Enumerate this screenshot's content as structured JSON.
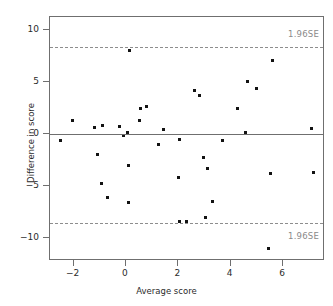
{
  "chart_data": {
    "type": "scatter",
    "title": "",
    "xlabel": "Average score",
    "ylabel": "Difference in score",
    "xlim": [
      -2.9,
      7.6
    ],
    "ylim": [
      -12.2,
      11.3
    ],
    "xticks": [
      -2,
      0,
      2,
      4,
      6
    ],
    "xticklabels": [
      "−2",
      "0",
      "2",
      "4",
      "6"
    ],
    "yticks": [
      -10,
      -5,
      0,
      5,
      10
    ],
    "yticklabels": [
      "−10",
      "−5",
      "0",
      "5",
      "10"
    ],
    "grid": false,
    "legend": null,
    "reference_lines": [
      {
        "name": "mean-difference",
        "y": 0,
        "style": "solid",
        "label": ""
      },
      {
        "name": "upper-limit-of-agreement",
        "y": 8.45,
        "style": "dashed",
        "label": "1.96SE"
      },
      {
        "name": "lower-limit-of-agreement",
        "y": -8.55,
        "style": "dashed",
        "label": "1.96SE"
      }
    ],
    "annotations": [
      {
        "name": "upper-loa-label",
        "text": "1.96SE",
        "x": 6.6,
        "y": 9.6
      },
      {
        "name": "lower-loa-label",
        "text": "1.96SE",
        "x": 6.6,
        "y": -9.9
      }
    ],
    "x": [
      -2.5,
      -2.05,
      -1.2,
      -1.1,
      -0.9,
      -0.95,
      -0.7,
      -0.25,
      -0.1,
      0.05,
      0.1,
      0.1,
      0.15,
      0.5,
      0.55,
      0.8,
      1.25,
      1.45,
      2.0,
      2.05,
      2.05,
      2.3,
      2.6,
      2.8,
      2.95,
      3.05,
      3.1,
      3.3,
      3.7,
      4.25,
      4.55,
      4.65,
      5.0,
      5.45,
      5.5,
      5.6,
      7.1,
      7.15
    ],
    "y": [
      -0.6,
      1.35,
      0.7,
      -1.9,
      0.85,
      -4.7,
      -6.1,
      0.8,
      -0.15,
      0.15,
      -3.05,
      -6.6,
      8.1,
      1.3,
      2.5,
      2.7,
      -0.95,
      0.45,
      -4.2,
      -0.5,
      -8.4,
      -8.4,
      4.2,
      3.75,
      -2.2,
      -8.0,
      -3.25,
      -6.5,
      -0.55,
      2.5,
      0.2,
      5.1,
      4.4,
      -11.0,
      -3.8,
      7.1,
      0.6,
      -3.7
    ],
    "marker": {
      "shape": "square",
      "color": "#131313",
      "size": 3
    },
    "n_points": 38
  },
  "style": {
    "frame_color": "#6f6f6f",
    "dash_color": "#8d8d8d",
    "text_color": "#2b2b2b",
    "annotation_color": "#8a8a8a",
    "background": "#ffffff"
  }
}
